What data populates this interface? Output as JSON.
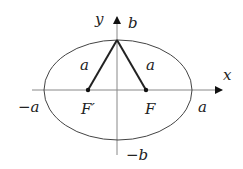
{
  "diagram": {
    "axes": {
      "x_label": "x",
      "y_label": "y"
    },
    "ellipse": {
      "semi_major_label": "a",
      "semi_minor_label": "b"
    },
    "vertex_labels": {
      "left": "−a",
      "right": "a",
      "top": "b",
      "bottom": "−b"
    },
    "foci": [
      {
        "name": "F'",
        "label": "F′"
      },
      {
        "name": "F",
        "label": "F"
      }
    ],
    "segment_labels": {
      "left": "a",
      "right": "a"
    },
    "colors": {
      "ellipse": "#444444",
      "axes": "#888888",
      "segments": "#222222",
      "text": "#222222"
    }
  }
}
